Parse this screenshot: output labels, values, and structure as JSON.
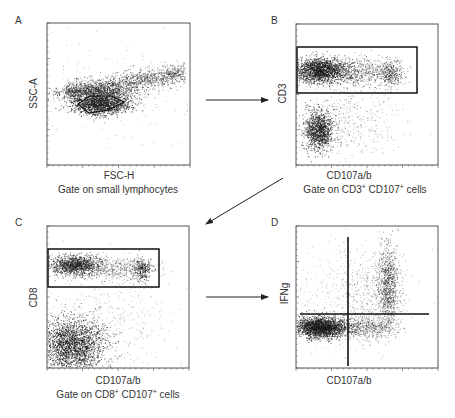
{
  "figure": {
    "panels": [
      {
        "letter": "A",
        "x_label": "FSC-H",
        "y_label": "SSC-A",
        "caption": "Gate on small lymphocytes",
        "gate_type": "polygon"
      },
      {
        "letter": "B",
        "x_label": "CD107a/b",
        "y_label": "CD3",
        "caption_parts": [
          "Gate on CD3",
          "+",
          " CD107",
          "+",
          " cells"
        ],
        "gate_type": "rectangle"
      },
      {
        "letter": "C",
        "x_label": "CD107a/b",
        "y_label": "CD8",
        "caption_parts": [
          "Gate on CD8",
          "+",
          " CD107",
          "+",
          " cells"
        ],
        "gate_type": "rectangle"
      },
      {
        "letter": "D",
        "x_label": "CD107a/b",
        "y_label": "IFNg",
        "caption": "",
        "gate_type": "quadrant"
      }
    ],
    "arrows": [
      {
        "from": "A",
        "to": "B"
      },
      {
        "from": "B",
        "to": "C"
      },
      {
        "from": "C",
        "to": "D"
      }
    ],
    "colors": {
      "ink": "#222222",
      "frame": "#555555",
      "dots": "#1a1a1a"
    }
  }
}
